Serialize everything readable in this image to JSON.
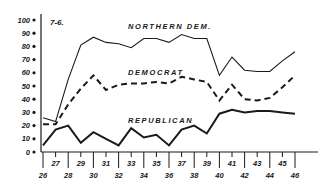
{
  "figure_label": "7-6.",
  "chart_data": {
    "type": "line",
    "title": "7-6.",
    "xlabel": "",
    "ylabel": "",
    "x": [
      26,
      27,
      28,
      29,
      30,
      31,
      32,
      33,
      34,
      35,
      36,
      37,
      38,
      39,
      40,
      41,
      42,
      43,
      44,
      45,
      46
    ],
    "x_tick_labels_lower": [
      "26",
      "28",
      "30",
      "32",
      "34",
      "36",
      "38",
      "40",
      "42",
      "44",
      "46"
    ],
    "x_tick_labels_upper": [
      "27",
      "29",
      "31",
      "33",
      "35",
      "37",
      "39",
      "41",
      "43",
      "45"
    ],
    "y_ticks": [
      0,
      10,
      20,
      30,
      40,
      50,
      60,
      70,
      80,
      90,
      100
    ],
    "ylim": [
      0,
      100
    ],
    "xlim": [
      26,
      46
    ],
    "grid": false,
    "legend": "inline labels",
    "series": [
      {
        "name": "NORTHERN DEM.",
        "style": "solid-thin",
        "values": [
          26,
          23,
          55,
          81,
          87,
          83,
          82,
          79,
          86,
          86,
          83,
          89,
          86,
          86,
          58,
          72,
          62,
          61,
          61,
          69,
          76
        ]
      },
      {
        "name": "DEMOCRAT",
        "style": "dashed",
        "values": [
          21,
          21,
          36,
          48,
          58,
          47,
          51,
          52,
          52,
          53,
          52,
          57,
          55,
          53,
          39,
          51,
          40,
          39,
          41,
          49,
          58
        ]
      },
      {
        "name": "REPUBLICAN",
        "style": "solid-thick",
        "values": [
          5,
          17,
          20,
          7,
          15,
          10,
          5,
          18,
          11,
          13,
          5,
          17,
          20,
          14,
          29,
          32,
          30,
          31,
          31,
          30,
          29
        ]
      }
    ]
  },
  "colors": {
    "ink": "#1a1a1a",
    "background": "#ffffff"
  }
}
